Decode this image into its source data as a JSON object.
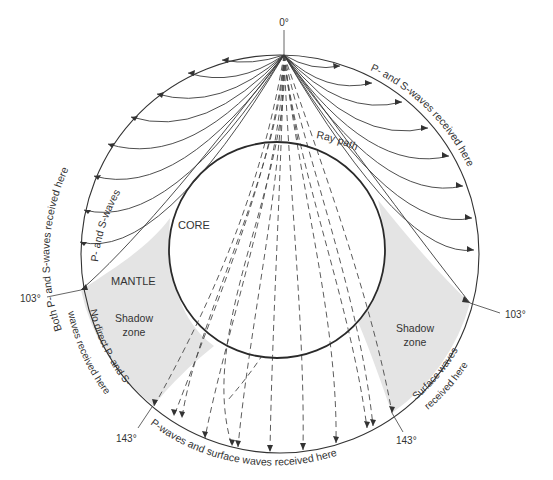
{
  "diagram": {
    "regions": {
      "core": "CORE",
      "mantle": "MANTLE",
      "shadow_left_1": "Shadow",
      "shadow_left_2": "zone",
      "shadow_right_1": "Shadow",
      "shadow_right_2": "zone"
    },
    "angles": {
      "top": "0°",
      "left_103": "103°",
      "right_103": "103°",
      "left_143": "143°",
      "right_143": "143°"
    },
    "arc_labels": {
      "left_outer": "Both P- and S-waves received here",
      "left_inner": "P- and S-waves",
      "right_outer": "P- and S-waves received here",
      "right_inner": "Ray path",
      "left_shadow_1": "No direct P- and S-",
      "left_shadow_2": "waves received here",
      "right_shadow_1": "Surface waves",
      "right_shadow_2": "received here",
      "bottom": "P-waves and surface waves received here"
    },
    "colors": {
      "shadow_fill": "#e4e4e4",
      "line": "#333333",
      "background": "#ffffff"
    }
  }
}
